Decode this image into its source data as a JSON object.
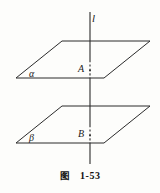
{
  "figure": {
    "caption_word": "图",
    "caption_number": "1-53",
    "line_label": "l",
    "plane_upper_label": "α",
    "plane_lower_label": "β",
    "point_upper_label": "A",
    "point_lower_label": "B",
    "stroke_color": "#2b2b2b",
    "background_color": "#fdfdfb",
    "geometry": {
      "line_x": 90,
      "line_top_y": 12,
      "line_bottom_y": 164,
      "plane_upper": {
        "tl_x": 62,
        "tl_y": 41,
        "tr_x": 150,
        "tr_y": 41,
        "br_x": 104,
        "br_y": 78,
        "bl_x": 16,
        "bl_y": 78
      },
      "plane_lower": {
        "tl_x": 62,
        "tl_y": 106,
        "tr_x": 150,
        "tr_y": 106,
        "br_x": 104,
        "br_y": 143,
        "bl_x": 16,
        "bl_y": 143
      },
      "dash_upper": {
        "x": 90,
        "y1": 60,
        "y2": 79
      },
      "dash_lower": {
        "x": 90,
        "y1": 125,
        "y2": 144
      }
    }
  }
}
